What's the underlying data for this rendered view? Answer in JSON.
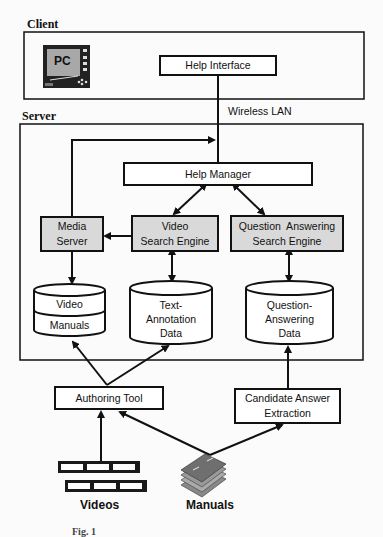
{
  "diagram": {
    "groups": {
      "client": {
        "label": "Client"
      },
      "server": {
        "label": "Server"
      }
    },
    "connection_label": "Wireless LAN",
    "icons": {
      "pc": {
        "label": "PC"
      },
      "videos": {
        "label": "Videos"
      },
      "manuals": {
        "label": "Manuals"
      }
    },
    "nodes": {
      "help_interface": {
        "label": "Help Interface"
      },
      "help_manager": {
        "label": "Help Manager"
      },
      "media_server": {
        "line1": "Media",
        "line2": "Server"
      },
      "video_search_engine": {
        "line1": "Video",
        "line2": "Search Engine"
      },
      "qa_search_engine": {
        "line1": "Question  Answering",
        "line2": "Search Engine"
      },
      "authoring_tool": {
        "label": "Authoring Tool"
      },
      "candidate_answer_extraction": {
        "line1": "Candidate Answer",
        "line2": "Extraction"
      }
    },
    "databases": {
      "video_manuals": {
        "line1": "Video",
        "line2": "Manuals"
      },
      "text_annotation": {
        "line1": "Text-",
        "line2": "Annotation",
        "line3": "Data"
      },
      "qa_data": {
        "line1": "Question-",
        "line2": "Answering",
        "line3": "Data"
      }
    },
    "caption": "Fig. 1"
  },
  "colors": {
    "stroke": "#111111",
    "shaded_fill": "#d9d9d9",
    "pc_screen": "#a8a8a8"
  }
}
